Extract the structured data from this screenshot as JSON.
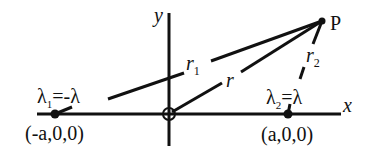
{
  "diagram": {
    "title": "",
    "axes": {
      "x_label": "x",
      "y_label": "y",
      "origin_symbol": "circle-cross"
    },
    "point": {
      "label": "P"
    },
    "charges": [
      {
        "name": "lambda1",
        "label_symbol": "λ",
        "label_sub": "1",
        "label_rest": "=-λ",
        "position_label": "(-a,0,0)"
      },
      {
        "name": "lambda2",
        "label_symbol": "λ",
        "label_sub": "2",
        "label_rest": "=λ",
        "position_label": "(a,0,0)"
      }
    ],
    "distances": [
      {
        "name": "r1",
        "symbol": "r",
        "sub": "1"
      },
      {
        "name": "r",
        "symbol": "r",
        "sub": ""
      },
      {
        "name": "r2",
        "symbol": "r",
        "sub": "2"
      }
    ],
    "colors": {
      "stroke": "#111111",
      "background": "#ffffff"
    }
  }
}
